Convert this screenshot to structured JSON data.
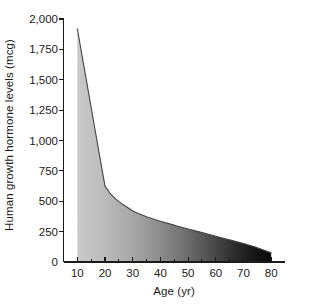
{
  "chart_data": {
    "type": "area",
    "title": "",
    "subtitle": "",
    "xlabel": "Age (yr)",
    "ylabel": "Human growth hormone levels (mcg)",
    "xlim": [
      5,
      85
    ],
    "ylim": [
      0,
      2000
    ],
    "xticks": [
      10,
      20,
      30,
      40,
      50,
      60,
      70,
      80
    ],
    "xtick_labels": [
      "10",
      "20",
      "30",
      "40",
      "50",
      "60",
      "70",
      "80"
    ],
    "xminor_ticks": [
      15,
      25,
      35,
      45,
      55,
      65,
      75
    ],
    "yticks": [
      0,
      250,
      500,
      750,
      1000,
      1250,
      1500,
      1750,
      2000
    ],
    "ytick_labels": [
      "0",
      "250",
      "500",
      "750",
      "1,000",
      "1,250",
      "1,500",
      "1,750",
      "2,000"
    ],
    "grid": false,
    "legend": null,
    "legend_position": "none",
    "x": [
      10,
      11,
      12,
      13,
      14,
      15,
      16,
      17,
      18,
      19,
      20,
      22,
      24,
      26,
      28,
      30,
      32,
      35,
      38,
      40,
      43,
      46,
      50,
      54,
      58,
      62,
      66,
      70,
      74,
      78,
      80
    ],
    "values": [
      1920,
      1790,
      1660,
      1530,
      1400,
      1270,
      1140,
      1010,
      880,
      750,
      625,
      560,
      515,
      480,
      450,
      420,
      400,
      372,
      350,
      336,
      316,
      296,
      272,
      248,
      224,
      200,
      176,
      152,
      126,
      92,
      75
    ],
    "series": [
      {
        "name": "Human growth hormone levels",
        "values": [
          1920,
          1790,
          1660,
          1530,
          1400,
          1270,
          1140,
          1010,
          880,
          750,
          625,
          560,
          515,
          480,
          450,
          420,
          400,
          372,
          350,
          336,
          316,
          296,
          272,
          248,
          224,
          200,
          176,
          152,
          126,
          92,
          75
        ]
      }
    ],
    "annotations": [],
    "peak_value": 1920,
    "peak_age": 10,
    "knee_value": 625,
    "knee_age": 20,
    "end_value": 75,
    "end_age": 80,
    "fill_gradient_start": "#c8c8c8",
    "fill_gradient_end": "#0a0a0a",
    "line_color": "#3a3a3a",
    "axis_color": "#1a1a1a",
    "background": "#ffffff"
  }
}
